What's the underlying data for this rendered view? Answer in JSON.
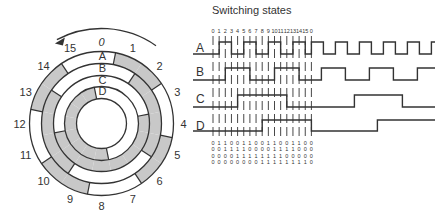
{
  "diagram": {
    "type": "gray-code-encoder-disk",
    "disk": {
      "center": [
        101.5,
        123.5
      ],
      "rings": [
        {
          "name": "A",
          "r_outer": 72,
          "r_inner": 60
        },
        {
          "name": "B",
          "r_outer": 60,
          "r_inner": 48
        },
        {
          "name": "C",
          "r_outer": 48,
          "r_inner": 37
        },
        {
          "name": "D",
          "r_outer": 37,
          "r_inner": 25
        }
      ],
      "positions": [
        "0",
        "1",
        "2",
        "3",
        "4",
        "5",
        "6",
        "7",
        "8",
        "9",
        "10",
        "11",
        "12",
        "13",
        "14",
        "15"
      ],
      "rotation_arrow": "counter-clockwise",
      "ring_labels": [
        "A",
        "B",
        "C",
        "D"
      ],
      "shade_color": "#c8c8c8",
      "line_color": "#333333"
    },
    "switching": {
      "title": "Switching states",
      "state_numbers": [
        "0",
        "1",
        "2",
        "3",
        "4",
        "5",
        "6",
        "7",
        "8",
        "9",
        "10",
        "11",
        "12",
        "13",
        "14",
        "15",
        "0"
      ],
      "channels": [
        {
          "name": "A",
          "bits": "0110011001100110"
        },
        {
          "name": "B",
          "bits": "0011110000111100"
        },
        {
          "name": "C",
          "bits": "0000111111110000"
        },
        {
          "name": "D",
          "bits": "0000000011111111"
        }
      ],
      "bit_rows": [
        "0 1 1  0 0 1 1 0 0 1 1 0 0 1 1 0 0",
        "0 0 1  1 1 1 0 0 0 0 1 1 1 1 0 0 0",
        "0 0 0  0 1 1 1 1 1 1 1 1 0 0 0 0 0",
        "0 0 0  0 0 0 0 0 1 1 1 1 1 1 1 1 0"
      ]
    }
  }
}
